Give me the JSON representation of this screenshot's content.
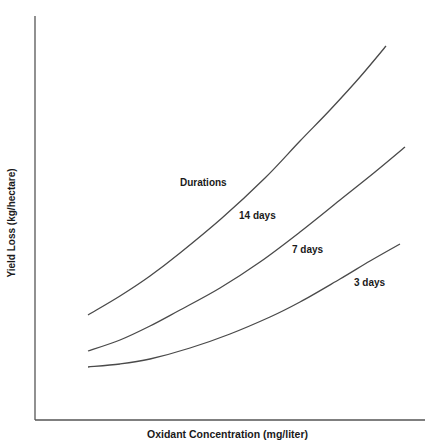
{
  "chart_data": {
    "type": "line",
    "title": "",
    "xlabel": "Oxidant Concentration (mg/liter)",
    "ylabel": "Yield Loss (kg/hectare)",
    "x_ticks": [],
    "y_ticks": [],
    "grid": false,
    "legend_title": "Durations",
    "note": "Qualitative curves with no numeric axis ticks; values are relative (0-100 scale of plot area).",
    "x": [
      0,
      20,
      40,
      60,
      80,
      100
    ],
    "series": [
      {
        "name": "14 days",
        "label": "14 days",
        "values": [
          26,
          37,
          51,
          66,
          82,
          100
        ]
      },
      {
        "name": "7 days",
        "label": "7 days",
        "values": [
          17,
          25,
          36,
          47,
          59,
          73
        ]
      },
      {
        "name": "3 days",
        "label": "3 days",
        "values": [
          13,
          16,
          22,
          31,
          40,
          49
        ]
      }
    ],
    "pixel_paths": {
      "14 days": [
        [
          88,
          315
        ],
        [
          120,
          296
        ],
        [
          150,
          276
        ],
        [
          180,
          253
        ],
        [
          222,
          218
        ],
        [
          265,
          178
        ],
        [
          300,
          141
        ],
        [
          330,
          110
        ],
        [
          360,
          77
        ],
        [
          386,
          46
        ]
      ],
      "7 days": [
        [
          88,
          351
        ],
        [
          120,
          340
        ],
        [
          150,
          326
        ],
        [
          180,
          310
        ],
        [
          220,
          288
        ],
        [
          260,
          262
        ],
        [
          300,
          232
        ],
        [
          340,
          200
        ],
        [
          375,
          172
        ],
        [
          405,
          147
        ]
      ],
      "3 days": [
        [
          88,
          367
        ],
        [
          120,
          364
        ],
        [
          150,
          359
        ],
        [
          190,
          348
        ],
        [
          230,
          334
        ],
        [
          270,
          317
        ],
        [
          300,
          302
        ],
        [
          340,
          279
        ],
        [
          370,
          261
        ],
        [
          400,
          244
        ]
      ]
    }
  },
  "labels": {
    "durations": "Durations",
    "d14": "14 days",
    "d7": "7 days",
    "d3": "3 days"
  }
}
